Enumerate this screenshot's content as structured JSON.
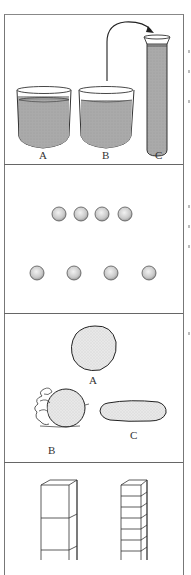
{
  "figure": {
    "panels": [
      {
        "id": "liquid",
        "description": "Conservation of liquid: beakers A and B, liquid from B poured into tall cylinder C",
        "labels": [
          "A",
          "B",
          "C"
        ],
        "colors": {
          "liquid": "#a9a9a9",
          "outline": "#333333"
        }
      },
      {
        "id": "number",
        "description": "Conservation of number: two rows of four coins",
        "rows": [
          {
            "count": 4,
            "spacing": "close"
          },
          {
            "count": 4,
            "spacing": "spread"
          }
        ]
      },
      {
        "id": "mass",
        "description": "Conservation of mass: clay ball A, ball B held in hand, clay rolled into sausage C",
        "labels": [
          "A",
          "B",
          "C"
        ]
      },
      {
        "id": "volume",
        "description": "Two towers of stacked blocks: large cubes vs many thin slabs"
      }
    ]
  }
}
